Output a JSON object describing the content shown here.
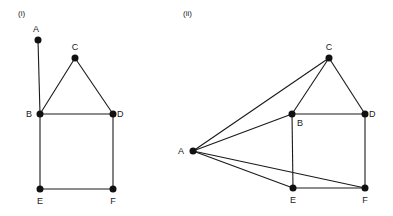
{
  "figures": [
    {
      "caption": "(i)",
      "caption_pos": [
        18,
        16
      ],
      "nodes": [
        {
          "id": "A",
          "x": 38,
          "y": 40,
          "lx": 36,
          "ly": 32,
          "anchor": "middle"
        },
        {
          "id": "C",
          "x": 75,
          "y": 58,
          "lx": 75,
          "ly": 50,
          "anchor": "middle"
        },
        {
          "id": "B",
          "x": 40,
          "y": 114,
          "lx": 32,
          "ly": 117,
          "anchor": "end"
        },
        {
          "id": "D",
          "x": 113,
          "y": 114,
          "lx": 117,
          "ly": 117,
          "anchor": "start"
        },
        {
          "id": "E",
          "x": 40,
          "y": 189,
          "lx": 40,
          "ly": 204,
          "anchor": "middle"
        },
        {
          "id": "F",
          "x": 113,
          "y": 189,
          "lx": 113,
          "ly": 204,
          "anchor": "middle"
        }
      ],
      "edges": [
        [
          "A",
          "B"
        ],
        [
          "B",
          "C"
        ],
        [
          "C",
          "D"
        ],
        [
          "B",
          "D"
        ],
        [
          "B",
          "E"
        ],
        [
          "D",
          "F"
        ],
        [
          "E",
          "F"
        ]
      ]
    },
    {
      "caption": "(ii)",
      "caption_pos": [
        183,
        16
      ],
      "nodes": [
        {
          "id": "C",
          "x": 329,
          "y": 58,
          "lx": 329,
          "ly": 50,
          "anchor": "middle"
        },
        {
          "id": "B",
          "x": 292,
          "y": 114,
          "lx": 300,
          "ly": 126,
          "anchor": "middle"
        },
        {
          "id": "D",
          "x": 365,
          "y": 114,
          "lx": 369,
          "ly": 117,
          "anchor": "start"
        },
        {
          "id": "A",
          "x": 193,
          "y": 151,
          "lx": 184,
          "ly": 154,
          "anchor": "end"
        },
        {
          "id": "E",
          "x": 293,
          "y": 188,
          "lx": 293,
          "ly": 203,
          "anchor": "middle"
        },
        {
          "id": "F",
          "x": 365,
          "y": 188,
          "lx": 365,
          "ly": 203,
          "anchor": "middle"
        }
      ],
      "edges": [
        [
          "A",
          "C"
        ],
        [
          "A",
          "B"
        ],
        [
          "A",
          "E"
        ],
        [
          "A",
          "F"
        ],
        [
          "C",
          "B"
        ],
        [
          "C",
          "D"
        ],
        [
          "B",
          "D"
        ],
        [
          "B",
          "E"
        ],
        [
          "D",
          "F"
        ],
        [
          "E",
          "F"
        ]
      ]
    }
  ],
  "style": {
    "line_color": "#1a1a1a",
    "node_color": "#111111",
    "node_radius": 3.5
  }
}
